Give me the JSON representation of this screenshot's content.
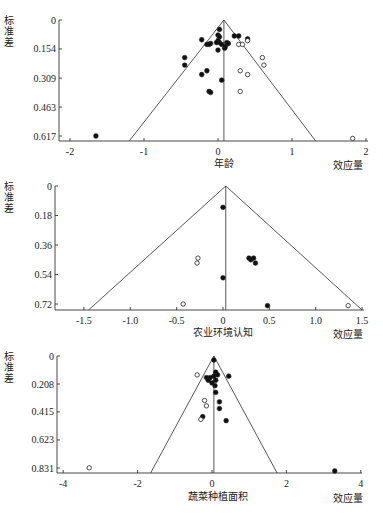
{
  "chart_data": [
    {
      "type": "scatter",
      "subtype": "funnel",
      "title": "",
      "xlabel": "年龄",
      "x_unit_label": "效应量",
      "ylabel": "标准差",
      "y_inverted": true,
      "yticks": [
        "0",
        "0.154",
        "0.309",
        "0.463",
        "0.617"
      ],
      "ytick_values": [
        0,
        0.154,
        0.309,
        0.463,
        0.617
      ],
      "xticks": [
        "-2",
        "-1",
        "0",
        "1",
        "2"
      ],
      "xtick_values": [
        -2,
        -1,
        0,
        1,
        2
      ],
      "xlim": [
        -2.15,
        2.0
      ],
      "ylim": [
        0,
        0.63
      ],
      "center_line": 0.08,
      "funnel_base": [
        -1.2,
        1.32
      ],
      "series": [
        {
          "name": "observed",
          "marker": "filled",
          "points": [
            [
              0.02,
              0.05
            ],
            [
              0.0,
              0.08
            ],
            [
              0.02,
              0.09
            ],
            [
              0.0,
              0.11
            ],
            [
              0.02,
              0.12
            ],
            [
              -0.02,
              0.12
            ],
            [
              -0.22,
              0.105
            ],
            [
              -0.15,
              0.13
            ],
            [
              -0.1,
              0.125
            ],
            [
              -0.12,
              0.13
            ],
            [
              0.05,
              0.13
            ],
            [
              0.12,
              0.12
            ],
            [
              0.14,
              0.125
            ],
            [
              0.1,
              0.14
            ],
            [
              0.09,
              0.15
            ],
            [
              0.0,
              0.16
            ],
            [
              0.22,
              0.085
            ],
            [
              0.28,
              0.085
            ],
            [
              0.4,
              0.1
            ],
            [
              -0.45,
              0.2
            ],
            [
              -0.45,
              0.24
            ],
            [
              -0.15,
              0.27
            ],
            [
              -0.22,
              0.29
            ],
            [
              0.05,
              0.32
            ],
            [
              -0.12,
              0.38
            ],
            [
              -0.1,
              0.385
            ],
            [
              -1.65,
              0.617
            ]
          ]
        },
        {
          "name": "imputed",
          "marker": "open",
          "points": [
            [
              0.28,
              0.13
            ],
            [
              0.33,
              0.13
            ],
            [
              0.4,
              0.11
            ],
            [
              0.6,
              0.2
            ],
            [
              0.62,
              0.24
            ],
            [
              0.3,
              0.27
            ],
            [
              0.4,
              0.29
            ],
            [
              0.3,
              0.38
            ],
            [
              1.82,
              0.63
            ]
          ]
        }
      ]
    },
    {
      "type": "scatter",
      "subtype": "funnel",
      "title": "",
      "xlabel": "农业环境认知",
      "x_unit_label": "效应量",
      "ylabel": "标准差",
      "y_inverted": true,
      "yticks": [
        "0",
        "0.18",
        "0.36",
        "0.54",
        "0.72"
      ],
      "ytick_values": [
        0,
        0.18,
        0.36,
        0.54,
        0.72
      ],
      "xticks": [
        "-1.5",
        "-1.0",
        "-0.5",
        "0",
        "0.5",
        "1.0",
        "1.5"
      ],
      "xtick_values": [
        -1.5,
        -1.0,
        -0.5,
        0,
        0.5,
        1.0,
        1.5
      ],
      "xlim": [
        -1.8,
        1.5
      ],
      "ylim": [
        0,
        0.74
      ],
      "center_line": 0.03,
      "funnel_base": [
        -1.45,
        1.5
      ],
      "series": [
        {
          "name": "observed",
          "marker": "filled",
          "points": [
            [
              0.0,
              0.13
            ],
            [
              0.28,
              0.44
            ],
            [
              0.3,
              0.45
            ],
            [
              0.33,
              0.44
            ],
            [
              0.35,
              0.47
            ],
            [
              0.0,
              0.56
            ],
            [
              0.48,
              0.73
            ]
          ]
        },
        {
          "name": "imputed",
          "marker": "open",
          "points": [
            [
              -0.27,
              0.44
            ],
            [
              -0.28,
              0.47
            ],
            [
              -0.43,
              0.72
            ],
            [
              1.35,
              0.73
            ]
          ]
        }
      ]
    },
    {
      "type": "scatter",
      "subtype": "funnel",
      "title": "",
      "xlabel": "蔬菜种植面积",
      "x_unit_label": "效应量",
      "ylabel": "标准差",
      "y_inverted": true,
      "yticks": [
        "0",
        "0.208",
        "0.415",
        "0.623",
        "0.831"
      ],
      "ytick_values": [
        0,
        0.208,
        0.415,
        0.623,
        0.831
      ],
      "xticks": [
        "-4",
        "-2",
        "0",
        "2",
        "4"
      ],
      "xtick_values": [
        -4,
        -2,
        0,
        2,
        4
      ],
      "xlim": [
        -4.2,
        4.0
      ],
      "ylim": [
        0,
        0.86
      ],
      "center_line": 0.05,
      "funnel_base": [
        -1.65,
        1.75
      ],
      "series": [
        {
          "name": "observed",
          "marker": "filled",
          "points": [
            [
              0.05,
              0.03
            ],
            [
              0.1,
              0.12
            ],
            [
              0.15,
              0.14
            ],
            [
              0.05,
              0.15
            ],
            [
              -0.05,
              0.16
            ],
            [
              -0.15,
              0.16
            ],
            [
              -0.1,
              0.18
            ],
            [
              0.0,
              0.2
            ],
            [
              0.1,
              0.18
            ],
            [
              0.08,
              0.22
            ],
            [
              0.1,
              0.27
            ],
            [
              0.45,
              0.15
            ],
            [
              0.2,
              0.34
            ],
            [
              0.2,
              0.39
            ],
            [
              -0.25,
              0.45
            ],
            [
              0.38,
              0.48
            ],
            [
              3.3,
              0.86
            ]
          ]
        },
        {
          "name": "imputed",
          "marker": "open",
          "points": [
            [
              -0.4,
              0.14
            ],
            [
              -0.2,
              0.33
            ],
            [
              -0.15,
              0.37
            ],
            [
              -0.3,
              0.47
            ],
            [
              -3.3,
              0.83
            ]
          ]
        }
      ]
    }
  ]
}
